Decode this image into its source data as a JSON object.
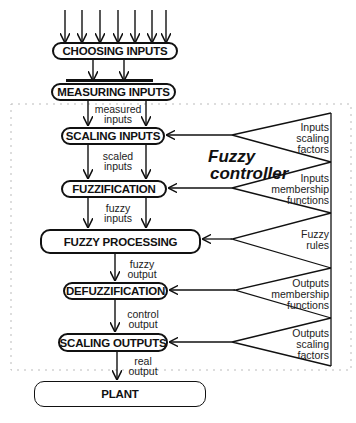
{
  "diagram": {
    "title_line1": "Fuzzy",
    "title_line2": "controller",
    "blocks": {
      "choosing": "CHOOSING INPUTS",
      "measuring": "MEASURING INPUTS",
      "scaling_in": "SCALING INPUTS",
      "fuzzification": "FUZZIFICATION",
      "processing": "FUZZY PROCESSING",
      "defuzzification": "DEFUZZIFICATION",
      "scaling_out": "SCALING OUTPUTS",
      "plant": "PLANT"
    },
    "signals": {
      "measured_1": "measured",
      "measured_2": "inputs",
      "scaled_1": "scaled",
      "scaled_2": "inputs",
      "fuzzy_in_1": "fuzzy",
      "fuzzy_in_2": "inputs",
      "fuzzy_out_1": "fuzzy",
      "fuzzy_out_2": "output",
      "control_1": "control",
      "control_2": "output",
      "real_1": "real",
      "real_2": "output"
    },
    "knowledge": [
      {
        "lines": [
          "Inputs",
          "scaling",
          "factors"
        ]
      },
      {
        "lines": [
          "Inputs",
          "membership",
          "functions"
        ]
      },
      {
        "lines": [
          "Fuzzy",
          "rules"
        ]
      },
      {
        "lines": [
          "Outputs",
          "membership",
          "functions"
        ]
      },
      {
        "lines": [
          "Outputs",
          "scaling",
          "factors"
        ]
      }
    ],
    "input_arrow_count": 7,
    "colors": {
      "line": "#111111",
      "dotted_border": "#bbbbbb",
      "background": "#ffffff"
    }
  }
}
